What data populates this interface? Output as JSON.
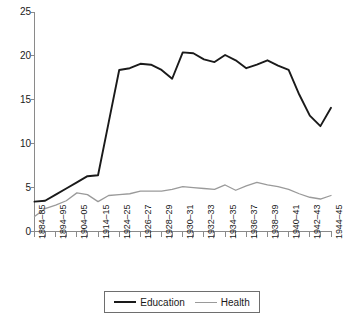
{
  "chart_data": {
    "type": "line",
    "title": "",
    "subtitle": "",
    "xlabel": "",
    "ylabel": "",
    "ylim": [
      0,
      25
    ],
    "yticks": [
      0,
      5,
      10,
      15,
      20,
      25
    ],
    "grid": false,
    "legend_position": "bottom-center",
    "x": [
      "1884-85",
      "1889-90",
      "1894-95",
      "1899-00",
      "1904-05",
      "1909-10",
      "1914-15",
      "1919-20",
      "1924-25",
      "1925-26",
      "1926-27",
      "1927-28",
      "1928-29",
      "1929-30",
      "1930-31",
      "1931-32",
      "1932-33",
      "1933-34",
      "1934-35",
      "1935-36",
      "1936-37",
      "1937-38",
      "1938-39",
      "1939-40",
      "1940-41",
      "1941-42",
      "1942-43",
      "1943-44",
      "1944-45"
    ],
    "tick_labels": [
      "1884–85",
      "",
      "1894–95",
      "",
      "1904–05",
      "",
      "1914–15",
      "",
      "1924–25",
      "",
      "1926–27",
      "",
      "1928–29",
      "",
      "1930–31",
      "",
      "1932–33",
      "",
      "1934–35",
      "",
      "1936–37",
      "",
      "1938–39",
      "",
      "1940–41",
      "",
      "1942–43",
      "",
      "1944–45"
    ],
    "series": [
      {
        "name": "Education",
        "color": "#1a1a1a",
        "values": [
          3.4,
          3.5,
          4.2,
          4.9,
          5.6,
          6.3,
          6.4,
          12.4,
          18.4,
          18.6,
          19.1,
          19.0,
          18.4,
          17.4,
          20.4,
          20.3,
          19.6,
          19.3,
          20.1,
          19.5,
          18.6,
          19.0,
          19.5,
          18.9,
          18.4,
          15.6,
          13.2,
          12.0,
          14.1
        ]
      },
      {
        "name": "Health",
        "color": "#9a9a9a",
        "values": [
          1.7,
          2.6,
          3.0,
          3.5,
          4.4,
          4.2,
          3.4,
          4.1,
          4.2,
          4.3,
          4.6,
          4.6,
          4.6,
          4.8,
          5.1,
          5.0,
          4.9,
          4.8,
          5.3,
          4.7,
          5.2,
          5.6,
          5.3,
          5.1,
          4.8,
          4.3,
          3.9,
          3.7,
          4.1
        ]
      }
    ]
  },
  "legend": {
    "items": [
      {
        "label": "Education"
      },
      {
        "label": "Health"
      }
    ]
  },
  "colors": {
    "education": "#1a1a1a",
    "health": "#9a9a9a",
    "axis": "#8a8a8a",
    "background": "#ffffff"
  }
}
